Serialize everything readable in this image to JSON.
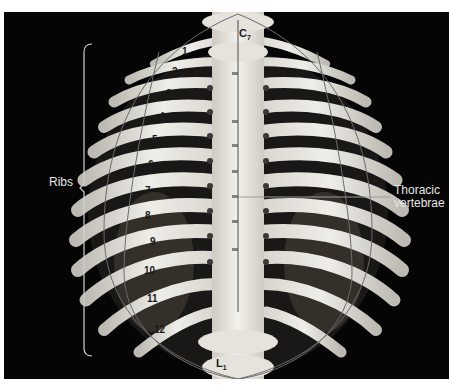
{
  "figure": {
    "background_color": "#050505",
    "bone_color": "#e8e6e0",
    "labels": {
      "ribs": "Ribs",
      "thoracic_vertebrae_line1": "Thoracic",
      "thoracic_vertebrae_line2": "vertebrae"
    },
    "vertebra_labels": {
      "top": {
        "letter": "C",
        "sub": "7"
      },
      "bottom": {
        "letter": "L",
        "sub": "1"
      }
    },
    "rib_numbers": [
      "1",
      "2",
      "3",
      "4",
      "5",
      "6",
      "7",
      "8",
      "9",
      "10",
      "11",
      "12"
    ]
  }
}
